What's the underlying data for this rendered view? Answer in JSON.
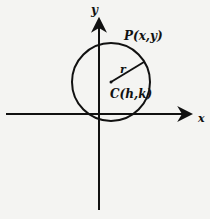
{
  "diagram": {
    "axes": {
      "x_label": "x",
      "y_label": "y"
    },
    "labels": {
      "point": "P(x,y)",
      "center": "C(h,k)",
      "radius": "r"
    },
    "colors": {
      "stroke": "#111111",
      "background": "#f4f4f2"
    }
  }
}
